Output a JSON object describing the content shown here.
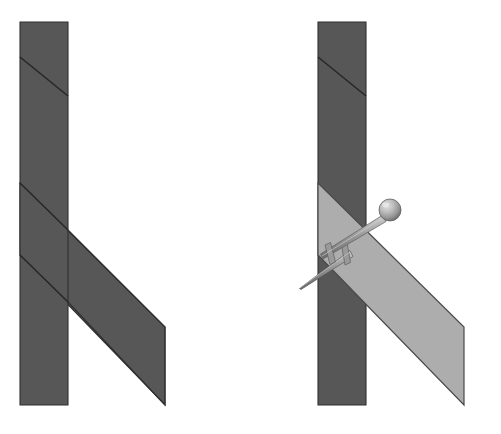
{
  "figure": {
    "type": "technical-illustration",
    "canvas": {
      "width": 501,
      "height": 434
    },
    "background_color": "#ffffff"
  },
  "colors": {
    "post_fill": "#575757",
    "post_edge": "#2f2f2f",
    "brace_dark_fill": "#575757",
    "brace_highlight_fill": "#adadad",
    "brace_highlight_edge": "#4a4a4a",
    "seam_line": "#262626",
    "nail_body": "#8d8d8d",
    "nail_shade": "#6d6d6d",
    "nail_highlight": "#d6d6d6",
    "nail_head_sphere": "#b4b4b4"
  },
  "panels": [
    {
      "id": "panel-left",
      "name": "unfastened-assembly",
      "label": "",
      "origin_x": 0,
      "parts": [
        {
          "name": "vertical-post",
          "shape": "rectangle",
          "fill": "post_fill",
          "points": "20,22 68,22 68,405 20,405"
        },
        {
          "name": "post-upper-seam",
          "shape": "line",
          "points": "20,57 68,96"
        },
        {
          "name": "diagonal-brace",
          "shape": "parallelogram",
          "fill": "brace_dark_fill",
          "points": "20,183 165,327 165,405 20,255"
        }
      ],
      "fasteners": []
    },
    {
      "id": "panel-right",
      "name": "fastened-assembly",
      "label": "",
      "origin_x": 298,
      "parts": [
        {
          "name": "vertical-post",
          "shape": "rectangle",
          "fill": "post_fill",
          "points": "318,22 366,22 366,405 318,405"
        },
        {
          "name": "post-upper-seam",
          "shape": "line",
          "points": "318,57 366,96"
        },
        {
          "name": "diagonal-brace",
          "shape": "parallelogram",
          "fill": "brace_highlight_fill",
          "points": "318,183 464,327 464,405 318,255"
        }
      ],
      "fasteners": [
        {
          "name": "upper-pin-with-ball-head",
          "type": "ball-head-pin",
          "head": {
            "cx": 390,
            "cy": 210,
            "r": 11
          },
          "shaft": {
            "x1": 383,
            "y1": 217,
            "x2": 322,
            "y2": 258
          },
          "crossbar": {
            "x1": 327,
            "y1": 247,
            "x2": 333,
            "y2": 262
          }
        },
        {
          "name": "lower-nail-spike",
          "type": "tapered-nail",
          "tip": {
            "x": 299,
            "y": 288
          },
          "shaft": {
            "x1": 299,
            "y1": 288,
            "x2": 352,
            "y2": 254
          },
          "crossbar": {
            "x1": 342,
            "y1": 243,
            "x2": 348,
            "y2": 263
          }
        }
      ]
    }
  ],
  "annotations": {
    "caption": "",
    "legend": []
  }
}
